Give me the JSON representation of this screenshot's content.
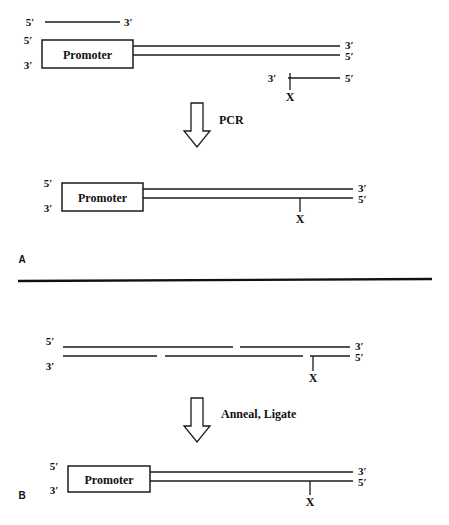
{
  "figure": {
    "background_color": "#ffffff",
    "ink_color": "#1b1b1b",
    "width": 449,
    "height": 525
  },
  "labels": {
    "five_prime": "5′",
    "three_prime": "3′",
    "promoter": "Promoter",
    "modification": "X"
  },
  "panels": [
    {
      "id": "A",
      "panel_label": "A",
      "panel_label_pos": {
        "x": 22,
        "y": 263
      },
      "divider": {
        "x1": 18,
        "y1": 281,
        "x2": 432,
        "y2": 279
      },
      "step": {
        "label": "PCR",
        "label_pos": {
          "x": 219,
          "y": 124
        },
        "arrow": {
          "x": 184,
          "y": 103,
          "width": 26,
          "height": 44
        }
      },
      "reactants": [
        {
          "name": "forward-primer",
          "type": "single-strand",
          "line": {
            "x1": 45,
            "y1": 22,
            "x2": 120,
            "y2": 22
          },
          "left_label": {
            "text": "5′",
            "x": 30,
            "y": 26
          },
          "right_label": {
            "text": "3′",
            "x": 124,
            "y": 26
          }
        },
        {
          "name": "promoter-template",
          "type": "double-strand-with-box",
          "box": {
            "x": 42,
            "y": 40,
            "width": 91,
            "height": 28,
            "text": "Promoter"
          },
          "top_line": {
            "x1": 133,
            "y1": 46,
            "x2": 340,
            "y2": 46
          },
          "bottom_line": {
            "x1": 133,
            "y1": 55,
            "x2": 340,
            "y2": 55
          },
          "labels": [
            {
              "text": "5′",
              "x": 28,
              "y": 44
            },
            {
              "text": "3′",
              "x": 28,
              "y": 69
            },
            {
              "text": "3′",
              "x": 345,
              "y": 49
            },
            {
              "text": "5′",
              "x": 345,
              "y": 60
            }
          ]
        },
        {
          "name": "reverse-primer-modified",
          "type": "single-strand-modified",
          "line": {
            "x1": 288,
            "y1": 78,
            "x2": 340,
            "y2": 78
          },
          "tick": {
            "x": 290,
            "y1": 73,
            "y2": 90
          },
          "x_label": {
            "text": "X",
            "x": 290,
            "y": 101
          },
          "left_label": {
            "text": "3′",
            "x": 272,
            "y": 82
          },
          "right_label": {
            "text": "5′",
            "x": 345,
            "y": 82
          }
        }
      ],
      "products": [
        {
          "name": "pcr-product",
          "type": "double-strand-with-box",
          "box": {
            "x": 62,
            "y": 183,
            "width": 81,
            "height": 28,
            "text": "Promoter"
          },
          "top_line": {
            "x1": 143,
            "y1": 189,
            "x2": 353,
            "y2": 189
          },
          "bottom_line": {
            "x1": 143,
            "y1": 198,
            "x2": 353,
            "y2": 198
          },
          "tick": {
            "x": 300,
            "y1": 198,
            "y2": 212
          },
          "x_label": {
            "text": "X",
            "x": 300,
            "y": 223
          },
          "labels": [
            {
              "text": "5′",
              "x": 48,
              "y": 187
            },
            {
              "text": "3′",
              "x": 48,
              "y": 212
            },
            {
              "text": "3′",
              "x": 358,
              "y": 192
            },
            {
              "text": "5′",
              "x": 358,
              "y": 203
            }
          ]
        }
      ]
    },
    {
      "id": "B",
      "panel_label": "B",
      "panel_label_pos": {
        "x": 22,
        "y": 499
      },
      "step": {
        "label": "Anneal, Ligate",
        "label_pos": {
          "x": 221,
          "y": 418
        },
        "arrow": {
          "x": 184,
          "y": 398,
          "width": 26,
          "height": 44
        }
      },
      "reactants": [
        {
          "name": "nicked-duplex",
          "type": "nicked-double-strand",
          "top_segments": [
            {
              "x1": 63,
              "y1": 347,
              "x2": 233,
              "y2": 347
            },
            {
              "x1": 240,
              "y1": 347,
              "x2": 350,
              "y2": 347
            }
          ],
          "bottom_segments": [
            {
              "x1": 63,
              "y1": 356,
              "x2": 157,
              "y2": 356
            },
            {
              "x1": 165,
              "y1": 356,
              "x2": 303,
              "y2": 356
            },
            {
              "x1": 310,
              "y1": 356,
              "x2": 350,
              "y2": 356
            }
          ],
          "tick": {
            "x": 313,
            "y1": 356,
            "y2": 371
          },
          "x_label": {
            "text": "X",
            "x": 313,
            "y": 382
          },
          "labels": [
            {
              "text": "5′",
              "x": 50,
              "y": 345
            },
            {
              "text": "3′",
              "x": 50,
              "y": 370
            },
            {
              "text": "3′",
              "x": 355,
              "y": 350
            },
            {
              "text": "5′",
              "x": 355,
              "y": 361
            }
          ]
        }
      ],
      "products": [
        {
          "name": "ligated-construct",
          "type": "double-strand-with-box",
          "box": {
            "x": 68,
            "y": 466,
            "width": 82,
            "height": 26,
            "text": "Promoter"
          },
          "top_line": {
            "x1": 150,
            "y1": 472,
            "x2": 353,
            "y2": 472
          },
          "bottom_line": {
            "x1": 150,
            "y1": 481,
            "x2": 353,
            "y2": 481
          },
          "tick": {
            "x": 310,
            "y1": 481,
            "y2": 495
          },
          "x_label": {
            "text": "X",
            "x": 310,
            "y": 506
          },
          "labels": [
            {
              "text": "5′",
              "x": 54,
              "y": 470
            },
            {
              "text": "3′",
              "x": 54,
              "y": 494
            },
            {
              "text": "3′",
              "x": 358,
              "y": 475
            },
            {
              "text": "5′",
              "x": 358,
              "y": 486
            }
          ]
        }
      ]
    }
  ]
}
